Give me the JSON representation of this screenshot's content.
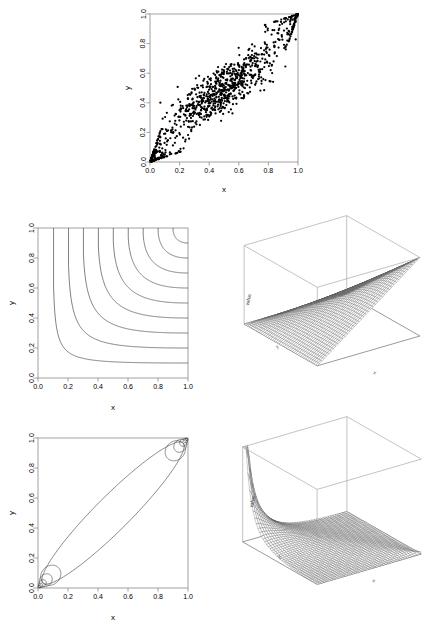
{
  "figure": {
    "background_color": "#ffffff",
    "ink_color": "#000000"
  },
  "panels": [
    {
      "id": "scatter",
      "role": "random-sample-scatter",
      "axis_x_title": "x",
      "axis_y_title": "y",
      "tick_labels_x": [
        "0.0",
        "0.2",
        "0.4",
        "0.6",
        "0.8",
        "1.0"
      ],
      "tick_labels_y": [
        "0.0",
        "0.2",
        "0.4",
        "0.6",
        "0.8",
        "1.0"
      ]
    },
    {
      "id": "cdf-contour",
      "role": "cdf-contour",
      "axis_x_title": "x",
      "axis_y_title": "y",
      "tick_labels_x": [
        "0.0",
        "0.2",
        "0.4",
        "0.6",
        "0.8",
        "1.0"
      ],
      "tick_labels_y": [
        "0.0",
        "0.2",
        "0.4",
        "0.6",
        "0.8",
        "1.0"
      ]
    },
    {
      "id": "cdf-perspective",
      "role": "cdf-surface-3d",
      "axis_x_title": "x",
      "axis_y_title": "y",
      "axis_z_title": "value"
    },
    {
      "id": "density-contour",
      "role": "density-contour",
      "axis_x_title": "x",
      "axis_y_title": "y",
      "tick_labels_x": [
        "0.0",
        "0.2",
        "0.4",
        "0.6",
        "0.8",
        "1.0"
      ],
      "tick_labels_y": [
        "0.0",
        "0.2",
        "0.4",
        "0.6",
        "0.8",
        "1.0"
      ]
    },
    {
      "id": "density-perspective",
      "role": "density-surface-3d",
      "axis_x_title": "x",
      "axis_y_title": "y",
      "axis_z_title": "value"
    }
  ],
  "chart_data": [
    {
      "type": "scatter",
      "id": "scatter",
      "title": "",
      "xlabel": "x",
      "ylabel": "y",
      "xlim": [
        0,
        1
      ],
      "ylim": [
        0,
        1
      ],
      "xticks": [
        0.0,
        0.2,
        0.4,
        0.6,
        0.8,
        1.0
      ],
      "yticks": [
        0.0,
        0.2,
        0.4,
        0.6,
        0.8,
        1.0
      ],
      "grid": false,
      "legend": "none",
      "n_points": 1000,
      "marker": "filled-circle",
      "marker_color": "#000000",
      "description": "Sample from a copula with positive dependence and heavy concentration in the lower-left and upper-right corners",
      "seed": 20240517,
      "dependence": "positive, tail-dependent both corners"
    },
    {
      "type": "line",
      "id": "cdf-contour",
      "title": "",
      "xlabel": "x",
      "ylabel": "y",
      "xlim": [
        0,
        1
      ],
      "ylim": [
        0,
        1
      ],
      "xticks": [
        0.0,
        0.2,
        0.4,
        0.6,
        0.8,
        1.0
      ],
      "yticks": [
        0.0,
        0.2,
        0.4,
        0.6,
        0.8,
        1.0
      ],
      "grid": false,
      "legend": "none",
      "levels": [
        0.1,
        0.2,
        0.3,
        0.4,
        0.5,
        0.6,
        0.7,
        0.8,
        0.9
      ],
      "description": "Contour lines of the copula distribution function; each level meets the top edge at x = level and the right edge at y = level"
    },
    {
      "type": "surface",
      "id": "cdf-perspective",
      "title": "",
      "xlabel": "x",
      "ylabel": "y",
      "zlabel": "value",
      "xlim": [
        0,
        1
      ],
      "ylim": [
        0,
        1
      ],
      "zlim": [
        0,
        1
      ],
      "grid_n": 46,
      "description": "Perspective wireframe of the copula CDF rising monotonically from 0 to 1"
    },
    {
      "type": "line",
      "id": "density-contour",
      "title": "",
      "xlabel": "x",
      "ylabel": "y",
      "xlim": [
        0,
        1
      ],
      "ylim": [
        0,
        1
      ],
      "xticks": [
        0.0,
        0.2,
        0.4,
        0.6,
        0.8,
        1.0
      ],
      "yticks": [
        0.0,
        0.2,
        0.4,
        0.6,
        0.8,
        1.0
      ],
      "grid": false,
      "legend": "none",
      "description": "Contours of the copula density: one broad ellipse along the diagonal plus nested loops collapsing into the (0,0) and (1,1) corners"
    },
    {
      "type": "surface",
      "id": "density-perspective",
      "title": "",
      "xlabel": "x",
      "ylabel": "y",
      "zlabel": "value",
      "xlim": [
        0,
        1
      ],
      "ylim": [
        0,
        1
      ],
      "grid_n": 46,
      "description": "Perspective wireframe of the copula density with sharp spikes at the two opposite corners"
    }
  ]
}
